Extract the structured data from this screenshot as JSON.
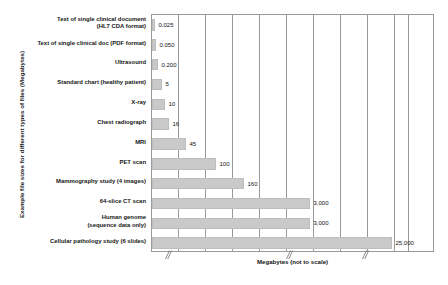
{
  "chart_data": {
    "type": "bar",
    "orientation": "horizontal",
    "title": "",
    "xlabel": "Megabytes (not to scale)",
    "ylabel": "Example file sizes for different types of files (Megabytes)",
    "grid": true,
    "legend": false,
    "axis_note": "not to scale",
    "categories": [
      "Text of single clinical document\n(HL7 CDA format)",
      "Text of single clinical doc (PDF format)",
      "Ultrasound",
      "Standard chart (healthy patient)",
      "X-ray",
      "Chest radiograph",
      "MRI",
      "PET scan",
      "Mammography study (4 images)",
      "64-slice CT scan",
      "Human genome\n(sequence data only)",
      "Cellular pathology study (6 slides)"
    ],
    "values": [
      0.025,
      0.05,
      0.2,
      5,
      10,
      16,
      45,
      100,
      160,
      3000,
      3000,
      25000
    ],
    "value_labels": [
      "0.025",
      "0.050",
      "0.200",
      "5",
      "10",
      "16",
      "45",
      "100",
      "160",
      "3,000",
      "3,000",
      "25,000"
    ],
    "bar_color": "#c9c9c9",
    "bar_edge_color": "#bdbdbd",
    "gridline_color": "#9a9a9a",
    "xlim": [
      0,
      283
    ],
    "gridline_positions": [
      26,
      53,
      80,
      107,
      134,
      161,
      188,
      215,
      242,
      256
    ],
    "bar_pixel_lengths": [
      3,
      4,
      6,
      10,
      13,
      17,
      34,
      64,
      92,
      158,
      158,
      240
    ],
    "axis_break_positions": [
      12,
      133,
      209
    ]
  }
}
